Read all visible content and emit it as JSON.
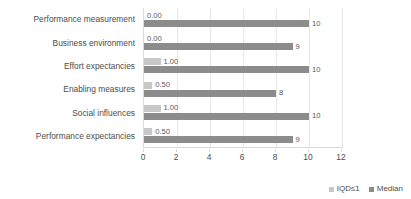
{
  "chart_data": {
    "type": "bar",
    "orientation": "horizontal",
    "title": "",
    "xlabel": "",
    "ylabel": "",
    "xlim": [
      0,
      12
    ],
    "xticks": [
      0,
      2,
      4,
      6,
      8,
      10,
      12
    ],
    "grid": true,
    "legend_position": "bottom-right",
    "categories": [
      "Performance measurement",
      "Business environment",
      "Effort expectancies",
      "Enabling measures",
      "Social influences",
      "Performance expectancies"
    ],
    "series": [
      {
        "name": "IQD≤1",
        "color": "#a6a6a6",
        "values": [
          0.0,
          0.0,
          1.0,
          0.5,
          1.0,
          0.5
        ],
        "labels": [
          "0.00",
          "0.00",
          "1.00",
          "0.50",
          "1.00",
          "0.50"
        ]
      },
      {
        "name": "Median",
        "color": "#8c8c8c",
        "values": [
          10,
          9,
          10,
          8,
          10,
          9
        ],
        "labels": [
          "10",
          "9",
          "10",
          "8",
          "10",
          "9"
        ]
      }
    ]
  },
  "legend": {
    "items": [
      {
        "label": "IQD≤1"
      },
      {
        "label": "Median"
      }
    ]
  },
  "colors": {
    "background": "#ffffff",
    "text": "#4d4d4d",
    "gridline": "#e8e8e8",
    "axis": "#d9d9d9"
  }
}
